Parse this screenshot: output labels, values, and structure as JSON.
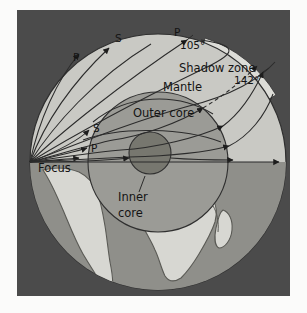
{
  "figure": {
    "background_color": "#4b4b4b",
    "page_color": "#fbfbfa"
  },
  "colors": {
    "panel_background": "#4b4b4b",
    "mantle": "#c9c9c4",
    "outer_core": "#9b9b96",
    "inner_core": "#77776f",
    "ocean_lower": "#8f8f8a",
    "land": "#d7d7d2",
    "ray_stroke": "#2b2b2b",
    "shadow_band": "#ddddd8",
    "label_text": "#141414"
  },
  "labels": {
    "focus": "Focus",
    "mantle": "Mantle",
    "outer_core": "Outer core",
    "inner_core_line1": "Inner",
    "inner_core_line2": "core",
    "shadow_zone": "Shadow zone",
    "angle_105": "105°",
    "angle_142": "142°",
    "p_upper_left": "P",
    "s_upper_left": "S",
    "p_top": "P",
    "s_lower_left": "S",
    "p_lower_left": "P"
  },
  "structure": {
    "layers": [
      {
        "name": "Mantle",
        "label": "Mantle"
      },
      {
        "name": "Outer core",
        "label": "Outer core"
      },
      {
        "name": "Inner core",
        "label": "Inner core"
      }
    ],
    "wave_types": [
      "P",
      "S"
    ],
    "shadow_zone_range_degrees": [
      105,
      142
    ],
    "source_label": "Focus"
  },
  "geometry": {
    "globe_center_x": 141,
    "globe_center_y": 152,
    "globe_radius": 128,
    "outer_core_center_x": 141,
    "outer_core_center_y": 152,
    "outer_core_radius": 70,
    "inner_core_center_x": 133,
    "inner_core_center_y": 143,
    "inner_core_radius": 21,
    "focus_x": 13,
    "focus_y": 152
  }
}
